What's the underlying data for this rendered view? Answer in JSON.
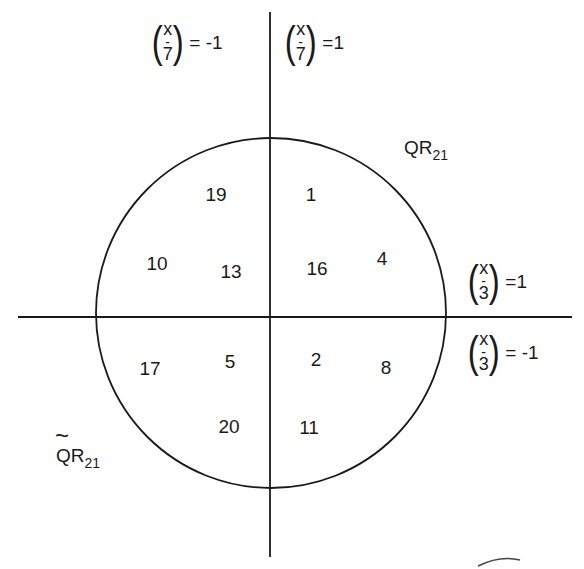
{
  "diagram": {
    "colors": {
      "stroke": "#1a1a1a",
      "background": "#ffffff"
    },
    "axes": {
      "vertical": {
        "x": 270,
        "y1": 12,
        "y2": 557
      },
      "horizontal": {
        "y": 317,
        "x1": 18,
        "x2": 572
      }
    },
    "circle": {
      "cx": 271,
      "cy": 313,
      "r": 175
    },
    "legendre_labels": {
      "top_left": {
        "numerator": "x",
        "bar": "-",
        "denominator": "7",
        "equals": "= -1"
      },
      "top_right": {
        "numerator": "x",
        "bar": "-",
        "denominator": "7",
        "equals": "=1"
      },
      "right_upper": {
        "numerator": "x",
        "bar": "-",
        "denominator": "3",
        "equals": "=1"
      },
      "right_lower": {
        "numerator": "x",
        "bar": "-",
        "denominator": "3",
        "equals": "= -1"
      }
    },
    "set_labels": {
      "qr": {
        "base": "QR",
        "sub": "21"
      },
      "qr_tilde": {
        "tilde": "~",
        "base": "QR",
        "sub": "21"
      }
    },
    "numbers": [
      {
        "value": "19",
        "x": 216,
        "y": 194
      },
      {
        "value": "1",
        "x": 311,
        "y": 194
      },
      {
        "value": "10",
        "x": 157,
        "y": 263
      },
      {
        "value": "13",
        "x": 231,
        "y": 271
      },
      {
        "value": "16",
        "x": 317,
        "y": 268
      },
      {
        "value": "4",
        "x": 382,
        "y": 258
      },
      {
        "value": "17",
        "x": 150,
        "y": 368
      },
      {
        "value": "5",
        "x": 230,
        "y": 361
      },
      {
        "value": "2",
        "x": 316,
        "y": 359
      },
      {
        "value": "8",
        "x": 386,
        "y": 367
      },
      {
        "value": "20",
        "x": 229,
        "y": 426
      },
      {
        "value": "11",
        "x": 309,
        "y": 427
      }
    ]
  }
}
